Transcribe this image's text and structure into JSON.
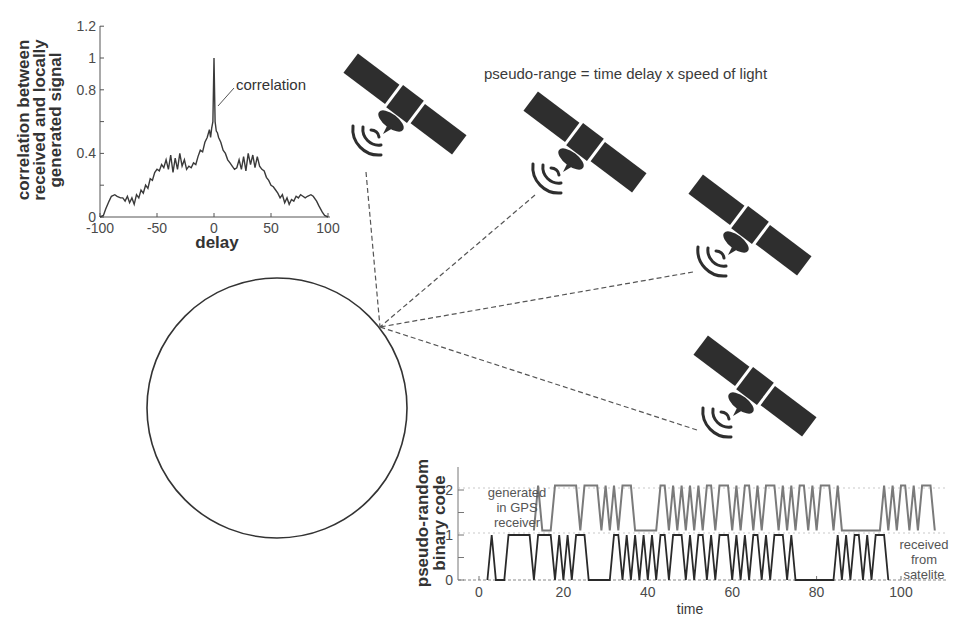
{
  "diagram": {
    "title_formula": "pseudo-range = time delay x speed of light",
    "satellites": [
      {
        "id": "satellite-1",
        "x": 405,
        "y": 104
      },
      {
        "id": "satellite-2",
        "x": 585,
        "y": 142
      },
      {
        "id": "satellite-3",
        "x": 750,
        "y": 225
      },
      {
        "id": "satellite-4",
        "x": 755,
        "y": 386
      }
    ],
    "receiver": {
      "cx": 277,
      "cy": 408,
      "r": 130,
      "antenna_point": [
        380,
        327
      ]
    },
    "signal_paths": [
      {
        "from": [
          366,
          172
        ],
        "to": [
          380,
          327
        ]
      },
      {
        "from": [
          535,
          195
        ],
        "to": [
          380,
          327
        ]
      },
      {
        "from": [
          693,
          272
        ],
        "to": [
          380,
          327
        ]
      },
      {
        "from": [
          697,
          430
        ],
        "to": [
          380,
          327
        ]
      }
    ]
  },
  "correlation_plot": {
    "ylabel_lines": [
      "correlation between",
      "received and locally",
      "generated signal"
    ],
    "xlabel": "delay",
    "annotation": "correlation",
    "xticks": [
      "-100",
      "-50",
      "0",
      "50",
      "100"
    ],
    "yticks": [
      "0",
      "0.4",
      "0.8",
      "1",
      "1.2"
    ]
  },
  "code_plot": {
    "ylabel_lines": [
      "pseudo-random",
      "binary code"
    ],
    "xlabel": "time",
    "xticks": [
      "0",
      "20",
      "40",
      "60",
      "80",
      "100"
    ],
    "yticks": [
      "0",
      "1",
      "2"
    ],
    "label_generated": [
      "generated",
      "in GPS",
      "receiver"
    ],
    "label_received": [
      "received",
      "from",
      "satelite"
    ]
  },
  "chart_data": [
    {
      "type": "line",
      "title": "",
      "xlabel": "delay",
      "ylabel": "correlation between received and locally generated signal",
      "xlim": [
        -100,
        100
      ],
      "ylim": [
        0,
        1.2
      ],
      "yticks": [
        0,
        0.2,
        0.4,
        0.6,
        0.8,
        1.0,
        1.2
      ],
      "series": [
        {
          "name": "correlation",
          "x": [
            -100,
            -97,
            -95,
            -92,
            -90,
            -87,
            -85,
            -82,
            -80,
            -78,
            -76,
            -74,
            -72,
            -70,
            -68,
            -66,
            -64,
            -62,
            -60,
            -58,
            -56,
            -54,
            -52,
            -50,
            -48,
            -46,
            -44,
            -42,
            -40,
            -38,
            -36,
            -34,
            -32,
            -30,
            -28,
            -26,
            -24,
            -22,
            -20,
            -18,
            -16,
            -14,
            -12,
            -10,
            -8,
            -6,
            -4,
            -3,
            -2,
            -1,
            0,
            1,
            2,
            3,
            4,
            6,
            8,
            10,
            12,
            14,
            16,
            18,
            20,
            22,
            24,
            26,
            28,
            30,
            32,
            34,
            36,
            38,
            40,
            42,
            44,
            46,
            48,
            50,
            52,
            54,
            56,
            58,
            60,
            62,
            64,
            66,
            68,
            70,
            72,
            74,
            76,
            78,
            80,
            82,
            85,
            87,
            90,
            92,
            95,
            97,
            100
          ],
          "y": [
            0,
            0.01,
            0.05,
            0.1,
            0.13,
            0.14,
            0.13,
            0.12,
            0.12,
            0.1,
            0.13,
            0.09,
            0.12,
            0.08,
            0.14,
            0.12,
            0.17,
            0.15,
            0.2,
            0.18,
            0.24,
            0.23,
            0.28,
            0.3,
            0.29,
            0.33,
            0.31,
            0.36,
            0.3,
            0.39,
            0.28,
            0.37,
            0.3,
            0.4,
            0.32,
            0.36,
            0.3,
            0.32,
            0.31,
            0.34,
            0.33,
            0.38,
            0.42,
            0.41,
            0.47,
            0.5,
            0.55,
            0.5,
            0.56,
            0.6,
            1.0,
            0.6,
            0.54,
            0.53,
            0.5,
            0.47,
            0.42,
            0.4,
            0.36,
            0.34,
            0.32,
            0.3,
            0.31,
            0.36,
            0.3,
            0.38,
            0.29,
            0.4,
            0.33,
            0.39,
            0.31,
            0.38,
            0.32,
            0.3,
            0.29,
            0.25,
            0.23,
            0.2,
            0.19,
            0.17,
            0.15,
            0.12,
            0.14,
            0.09,
            0.12,
            0.08,
            0.11,
            0.1,
            0.13,
            0.12,
            0.14,
            0.13,
            0.12,
            0.13,
            0.14,
            0.13,
            0.1,
            0.07,
            0.03,
            0.01,
            0
          ]
        }
      ],
      "annotations": [
        {
          "text": "correlation",
          "points_to": [
            0,
            0.72
          ]
        }
      ],
      "grid": false,
      "legend": "none"
    },
    {
      "type": "line",
      "title": "",
      "xlabel": "time",
      "ylabel": "pseudo-random binary code",
      "xlim": [
        -5,
        110
      ],
      "ylim": [
        0,
        2.5
      ],
      "series": [
        {
          "name": "received from satelite",
          "offset": 0,
          "color": "#2a2a2a",
          "bits_start_t": 2,
          "bits": [
            0,
            1,
            0,
            0,
            0,
            1,
            1,
            1,
            1,
            1,
            1,
            0,
            1,
            1,
            1,
            1,
            0,
            1,
            0,
            1,
            0,
            1,
            1,
            1,
            0,
            0,
            0,
            0,
            0,
            0,
            1,
            1,
            0,
            1,
            0,
            1,
            0,
            1,
            0,
            1,
            0,
            1,
            1,
            0,
            1,
            1,
            1,
            0,
            1,
            0,
            1,
            1,
            0,
            1,
            0,
            1,
            1,
            1,
            0,
            1,
            0,
            1,
            0,
            1,
            1,
            0,
            1,
            0,
            1,
            1,
            1,
            0,
            1,
            0,
            0,
            0,
            0,
            0,
            0,
            0,
            0,
            0,
            0,
            1,
            0,
            1,
            0,
            1,
            1,
            0,
            1,
            0,
            1,
            1,
            1,
            0
          ]
        },
        {
          "name": "generated in GPS receiver",
          "offset": 1.1,
          "color": "#7a7a7a",
          "bits_start_t": 13,
          "bits": [
            0,
            1,
            0,
            0,
            0,
            1,
            1,
            1,
            1,
            1,
            1,
            0,
            1,
            1,
            1,
            1,
            0,
            1,
            0,
            1,
            0,
            1,
            1,
            1,
            0,
            0,
            0,
            0,
            0,
            0,
            1,
            1,
            0,
            1,
            0,
            1,
            0,
            1,
            0,
            1,
            0,
            1,
            1,
            0,
            1,
            1,
            1,
            0,
            1,
            0,
            1,
            1,
            0,
            1,
            0,
            1,
            1,
            1,
            0,
            1,
            0,
            1,
            0,
            1,
            1,
            0,
            1,
            0,
            1,
            1,
            1,
            0,
            1,
            0,
            0,
            0,
            0,
            0,
            0,
            0,
            0,
            0,
            0,
            1,
            0,
            1,
            0,
            1,
            1,
            0,
            1,
            0,
            1,
            1,
            1,
            0
          ]
        }
      ],
      "grid": false,
      "legend": "inline labels"
    }
  ]
}
